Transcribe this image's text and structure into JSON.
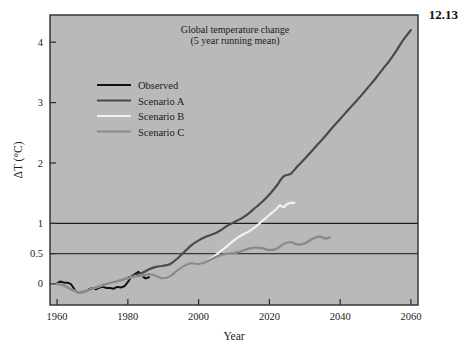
{
  "figure": {
    "number": "12.13",
    "background_color": "#b9b9b9",
    "page_color": "#ffffff"
  },
  "chart_data": {
    "type": "line",
    "title": "Global temperature change",
    "subtitle": "(5 year running mean)",
    "xlabel": "Year",
    "ylabel": "ΔT (°C)",
    "xlim": [
      1958,
      2062
    ],
    "ylim": [
      -0.35,
      4.45
    ],
    "xticks": [
      1960,
      1980,
      2000,
      2020,
      2040,
      2060
    ],
    "xtick_labels": [
      "1960",
      "1980",
      "2000",
      "2020",
      "2040",
      "2060"
    ],
    "yticks": [
      0,
      0.5,
      1,
      2,
      3,
      4
    ],
    "ytick_labels": [
      "0",
      "0.5",
      "1",
      "2",
      "3",
      "4"
    ],
    "grid": false,
    "reference_lines": [
      {
        "value": 0.5,
        "color": "#3a3a3a"
      },
      {
        "value": 1.0,
        "color": "#1c1c1c"
      }
    ],
    "legend_position": "upper left",
    "series": [
      {
        "name": "Observed",
        "color": "#101010",
        "width": 2.0,
        "points": [
          [
            1960,
            0.01
          ],
          [
            1961,
            0.04
          ],
          [
            1962,
            0.02
          ],
          [
            1963,
            0.02
          ],
          [
            1964,
            -0.01
          ],
          [
            1965,
            -0.1
          ],
          [
            1966,
            -0.15
          ],
          [
            1967,
            -0.14
          ],
          [
            1968,
            -0.13
          ],
          [
            1969,
            -0.09
          ],
          [
            1970,
            -0.07
          ],
          [
            1971,
            -0.09
          ],
          [
            1972,
            -0.06
          ],
          [
            1973,
            -0.05
          ],
          [
            1974,
            -0.07
          ],
          [
            1975,
            -0.07
          ],
          [
            1976,
            -0.08
          ],
          [
            1977,
            -0.05
          ],
          [
            1978,
            -0.06
          ],
          [
            1979,
            -0.04
          ],
          [
            1980,
            0.03
          ],
          [
            1981,
            0.12
          ],
          [
            1982,
            0.16
          ],
          [
            1983,
            0.2
          ],
          [
            1984,
            0.13
          ],
          [
            1985,
            0.09
          ],
          [
            1986,
            0.11
          ]
        ]
      },
      {
        "name": "Scenario A",
        "color": "#4a4a4a",
        "width": 2.2,
        "points": [
          [
            1960,
            0.0
          ],
          [
            1962,
            -0.03
          ],
          [
            1964,
            -0.09
          ],
          [
            1966,
            -0.14
          ],
          [
            1968,
            -0.12
          ],
          [
            1970,
            -0.08
          ],
          [
            1972,
            -0.04
          ],
          [
            1974,
            0.0
          ],
          [
            1976,
            0.03
          ],
          [
            1978,
            0.06
          ],
          [
            1980,
            0.1
          ],
          [
            1982,
            0.14
          ],
          [
            1984,
            0.18
          ],
          [
            1986,
            0.24
          ],
          [
            1988,
            0.28
          ],
          [
            1990,
            0.3
          ],
          [
            1992,
            0.33
          ],
          [
            1994,
            0.42
          ],
          [
            1996,
            0.53
          ],
          [
            1998,
            0.64
          ],
          [
            2000,
            0.72
          ],
          [
            2002,
            0.78
          ],
          [
            2004,
            0.82
          ],
          [
            2006,
            0.88
          ],
          [
            2008,
            0.96
          ],
          [
            2010,
            1.02
          ],
          [
            2012,
            1.08
          ],
          [
            2014,
            1.16
          ],
          [
            2016,
            1.26
          ],
          [
            2018,
            1.36
          ],
          [
            2020,
            1.48
          ],
          [
            2022,
            1.62
          ],
          [
            2024,
            1.78
          ],
          [
            2026,
            1.82
          ],
          [
            2028,
            1.95
          ],
          [
            2030,
            2.07
          ],
          [
            2032,
            2.2
          ],
          [
            2034,
            2.33
          ],
          [
            2036,
            2.46
          ],
          [
            2038,
            2.6
          ],
          [
            2040,
            2.73
          ],
          [
            2042,
            2.86
          ],
          [
            2044,
            2.99
          ],
          [
            2046,
            3.12
          ],
          [
            2048,
            3.26
          ],
          [
            2050,
            3.4
          ],
          [
            2052,
            3.55
          ],
          [
            2054,
            3.7
          ],
          [
            2056,
            3.87
          ],
          [
            2058,
            4.05
          ],
          [
            2060,
            4.2
          ]
        ]
      },
      {
        "name": "Scenario B",
        "color": "#f2f2f2",
        "width": 2.2,
        "points": [
          [
            1960,
            0.0
          ],
          [
            1962,
            -0.03
          ],
          [
            1964,
            -0.09
          ],
          [
            1966,
            -0.14
          ],
          [
            1968,
            -0.12
          ],
          [
            1970,
            -0.08
          ],
          [
            1972,
            -0.04
          ],
          [
            1974,
            0.0
          ],
          [
            1976,
            0.03
          ],
          [
            1978,
            0.06
          ],
          [
            1980,
            0.09
          ],
          [
            1982,
            0.12
          ],
          [
            1984,
            0.14
          ],
          [
            1986,
            0.16
          ],
          [
            1988,
            0.13
          ],
          [
            1990,
            0.09
          ],
          [
            1992,
            0.13
          ],
          [
            1994,
            0.22
          ],
          [
            1996,
            0.3
          ],
          [
            1998,
            0.34
          ],
          [
            2000,
            0.33
          ],
          [
            2002,
            0.36
          ],
          [
            2004,
            0.44
          ],
          [
            2006,
            0.53
          ],
          [
            2008,
            0.62
          ],
          [
            2010,
            0.72
          ],
          [
            2012,
            0.8
          ],
          [
            2014,
            0.86
          ],
          [
            2016,
            0.94
          ],
          [
            2018,
            1.04
          ],
          [
            2020,
            1.14
          ],
          [
            2022,
            1.24
          ],
          [
            2023,
            1.3
          ],
          [
            2024,
            1.27
          ],
          [
            2025,
            1.32
          ],
          [
            2026,
            1.34
          ],
          [
            2027,
            1.34
          ]
        ]
      },
      {
        "name": "Scenario C",
        "color": "#8a8a8a",
        "width": 2.4,
        "points": [
          [
            1960,
            0.0
          ],
          [
            1962,
            -0.03
          ],
          [
            1964,
            -0.09
          ],
          [
            1966,
            -0.14
          ],
          [
            1968,
            -0.12
          ],
          [
            1970,
            -0.08
          ],
          [
            1972,
            -0.04
          ],
          [
            1974,
            0.0
          ],
          [
            1976,
            0.03
          ],
          [
            1978,
            0.06
          ],
          [
            1980,
            0.09
          ],
          [
            1982,
            0.12
          ],
          [
            1984,
            0.14
          ],
          [
            1986,
            0.16
          ],
          [
            1988,
            0.13
          ],
          [
            1990,
            0.09
          ],
          [
            1992,
            0.13
          ],
          [
            1994,
            0.22
          ],
          [
            1996,
            0.3
          ],
          [
            1998,
            0.34
          ],
          [
            2000,
            0.33
          ],
          [
            2002,
            0.36
          ],
          [
            2004,
            0.42
          ],
          [
            2006,
            0.47
          ],
          [
            2008,
            0.5
          ],
          [
            2010,
            0.51
          ],
          [
            2012,
            0.54
          ],
          [
            2014,
            0.58
          ],
          [
            2016,
            0.6
          ],
          [
            2018,
            0.59
          ],
          [
            2020,
            0.56
          ],
          [
            2022,
            0.58
          ],
          [
            2024,
            0.66
          ],
          [
            2026,
            0.69
          ],
          [
            2028,
            0.65
          ],
          [
            2030,
            0.67
          ],
          [
            2032,
            0.74
          ],
          [
            2034,
            0.78
          ],
          [
            2036,
            0.75
          ],
          [
            2037,
            0.77
          ]
        ]
      }
    ]
  },
  "legend": {
    "items": [
      {
        "label": "Observed",
        "color": "#101010"
      },
      {
        "label": "Scenario A",
        "color": "#4a4a4a"
      },
      {
        "label": "Scenario B",
        "color": "#f2f2f2"
      },
      {
        "label": "Scenario C",
        "color": "#8a8a8a"
      }
    ]
  }
}
